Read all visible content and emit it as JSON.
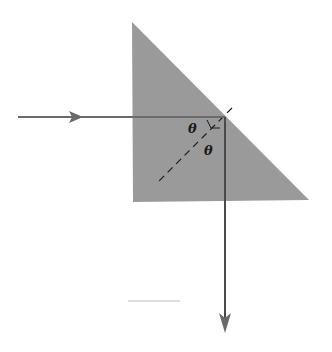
{
  "diagram": {
    "type": "right-angle prism total internal reflection",
    "prism": {
      "fill": "#9a9a9a",
      "vertices": [
        [
          132,
          22
        ],
        [
          133,
          202
        ],
        [
          309,
          200
        ]
      ]
    },
    "incident_ray": {
      "from": [
        18,
        117
      ],
      "to": [
        225,
        117
      ],
      "color": "#6b6b6b"
    },
    "reflected_ray": {
      "from": [
        225,
        117
      ],
      "to": [
        225,
        332
      ],
      "color": "#6b6b6b"
    },
    "normal_line": {
      "from": [
        232,
        108
      ],
      "to": [
        158,
        180
      ],
      "style": "dashed"
    },
    "angle_labels": [
      {
        "text": "θ",
        "x": 188,
        "y": 133
      },
      {
        "text": "θ",
        "x": 204,
        "y": 155
      }
    ],
    "stray_line": {
      "from": [
        128,
        301
      ],
      "to": [
        180,
        301
      ]
    }
  }
}
